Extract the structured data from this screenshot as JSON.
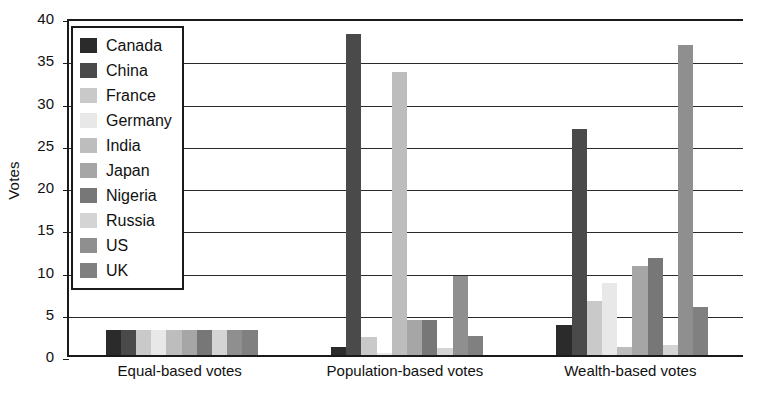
{
  "chart_data": {
    "type": "bar",
    "title": "",
    "subtitle": "",
    "xlabel": "",
    "ylabel": "Votes",
    "ylim": [
      0,
      40
    ],
    "yticks": [
      0,
      5,
      10,
      15,
      20,
      25,
      30,
      35,
      40
    ],
    "grid": true,
    "grid_axis": "y",
    "legend_position": "upper-left",
    "categories": [
      "Equal-based votes",
      "Population-based votes",
      "Wealth-based votes"
    ],
    "series": [
      {
        "name": "Canada",
        "color": "#2b2b2b",
        "values": [
          3.0,
          1.0,
          3.6
        ]
      },
      {
        "name": "China",
        "color": "#4a4a4a",
        "values": [
          3.0,
          38.0,
          26.7
        ]
      },
      {
        "name": "France",
        "color": "#c9c9c9",
        "values": [
          3.0,
          2.1,
          6.4
        ]
      },
      {
        "name": "Germany",
        "color": "#e8e8e8",
        "values": [
          3.0,
          0.2,
          8.5
        ]
      },
      {
        "name": "India",
        "color": "#bdbdbd",
        "values": [
          3.0,
          33.5,
          1.0
        ]
      },
      {
        "name": "Japan",
        "color": "#a6a6a6",
        "values": [
          3.0,
          4.1,
          10.5
        ]
      },
      {
        "name": "Nigeria",
        "color": "#777777",
        "values": [
          3.0,
          4.2,
          11.5
        ]
      },
      {
        "name": "Russia",
        "color": "#d4d4d4",
        "values": [
          3.0,
          0.8,
          1.2
        ]
      },
      {
        "name": "US",
        "color": "#8f8f8f",
        "values": [
          3.0,
          9.3,
          36.7
        ]
      },
      {
        "name": "UK",
        "color": "#808080",
        "values": [
          3.0,
          2.3,
          5.7
        ]
      }
    ]
  },
  "axes": {
    "y_title": "Votes",
    "y_tick_labels": [
      "0",
      "5",
      "10",
      "15",
      "20",
      "25",
      "30",
      "35",
      "40"
    ]
  },
  "legend": {
    "entries": [
      {
        "label": "Canada",
        "swatch": "legend-swatch-canada"
      },
      {
        "label": "China",
        "swatch": "legend-swatch-china"
      },
      {
        "label": "France",
        "swatch": "legend-swatch-france"
      },
      {
        "label": "Germany",
        "swatch": "legend-swatch-germany"
      },
      {
        "label": "India",
        "swatch": "legend-swatch-india"
      },
      {
        "label": "Japan",
        "swatch": "legend-swatch-japan"
      },
      {
        "label": "Nigeria",
        "swatch": "legend-swatch-nigeria"
      },
      {
        "label": "Russia",
        "swatch": "legend-swatch-russia"
      },
      {
        "label": "US",
        "swatch": "legend-swatch-us"
      },
      {
        "label": "UK",
        "swatch": "legend-swatch-uk"
      }
    ]
  },
  "x_axis_labels": [
    "Equal-based votes",
    "Population-based votes",
    "Wealth-based votes"
  ]
}
